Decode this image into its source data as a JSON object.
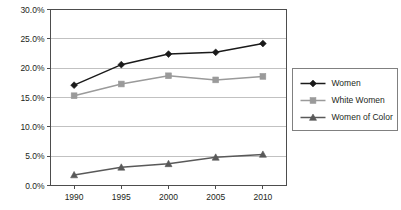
{
  "chart_data": {
    "type": "line",
    "title": "",
    "subtitle": "",
    "xlabel": "",
    "ylabel": "",
    "categories": [
      "1990",
      "1995",
      "2000",
      "2005",
      "2010"
    ],
    "x": [
      1990,
      1995,
      2000,
      2005,
      2010
    ],
    "xlim": [
      1987.5,
      2012.5
    ],
    "ylim": [
      0,
      30
    ],
    "ytick_values": [
      0,
      5,
      10,
      15,
      20,
      25,
      30
    ],
    "ytick_labels": [
      "0.0%",
      "5.0%",
      "10.0%",
      "15.0%",
      "20.0%",
      "25.0%",
      "30.0%"
    ],
    "xtick_labels": [
      "1990",
      "1995",
      "2000",
      "2005",
      "2010"
    ],
    "grid": "horizontal",
    "legend_position": "right",
    "series": [
      {
        "name": "Women",
        "marker": "diamond",
        "color": "#1a1a1a",
        "line_color": "#1a1a1a",
        "values": [
          17.1,
          20.6,
          22.4,
          22.7,
          24.2
        ]
      },
      {
        "name": "White Women",
        "marker": "square",
        "color": "#9a9a9a",
        "line_color": "#9a9a9a",
        "values": [
          15.3,
          17.3,
          18.7,
          18.0,
          18.6
        ]
      },
      {
        "name": "Women of Color",
        "marker": "triangle",
        "color": "#595959",
        "line_color": "#595959",
        "values": [
          1.8,
          3.1,
          3.7,
          4.8,
          5.3
        ]
      }
    ]
  },
  "legend": {
    "items": [
      {
        "label": "Women"
      },
      {
        "label": "White Women"
      },
      {
        "label": "Women of Color"
      }
    ]
  },
  "colors": {
    "background": "#ffffff",
    "axis": "#4d4d4d",
    "gridline": "#a6a6a6",
    "text": "#231f20",
    "legend_border": "#808080"
  }
}
